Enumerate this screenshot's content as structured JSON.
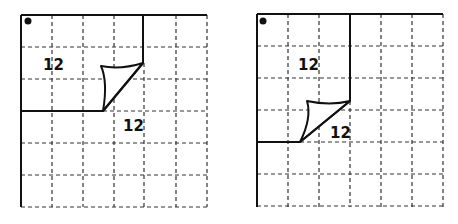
{
  "figures": [
    {
      "id": "left",
      "origin": [
        21,
        15
      ],
      "cell": 31,
      "cols": 6,
      "rows": 6,
      "labels": [
        {
          "text": "12",
          "x": 43,
          "y": 70
        },
        {
          "text": "12",
          "x": 123,
          "y": 131
        }
      ],
      "dot": {
        "x": 28,
        "y": 21
      },
      "fold_top": [
        143,
        63
      ],
      "fold_bottom": [
        103,
        111
      ],
      "flap_tip": [
        101,
        66
      ]
    },
    {
      "id": "right",
      "origin": [
        257,
        14
      ],
      "cell": 31,
      "cols": 6,
      "rows": 6,
      "labels": [
        {
          "text": "12",
          "x": 298,
          "y": 70
        },
        {
          "text": "12",
          "x": 330,
          "y": 138
        }
      ],
      "dot": {
        "x": 263,
        "y": 21
      },
      "fold_top": [
        350,
        101
      ],
      "fold_bottom": [
        300,
        142
      ],
      "flap_tip": [
        307,
        101
      ]
    }
  ],
  "colors": {
    "line": "#111111",
    "background": "#ffffff"
  }
}
